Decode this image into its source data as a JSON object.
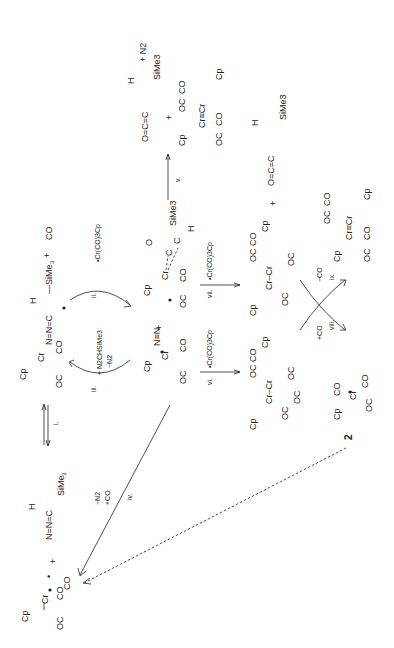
{
  "scheme": {
    "orientation": "rotated 90 degrees counterclockwise",
    "steps": {
      "i": "i.",
      "ii": "ii.",
      "iii": "iii.",
      "iv": "iv.",
      "v": "v.",
      "vi": "vi.",
      "vii": "vii.",
      "viii": "viii.",
      "ix": "ix."
    },
    "reagents": {
      "ii": "•Cr(CO)3Cp",
      "iii_top": "+ N2CHSiMe3",
      "iii_bottom": "−N2",
      "iv_top": "−N2",
      "iv_bottom": "+CO",
      "vi": "•Cr(CO)3Cp",
      "vii": "•Cr(CO)3Cp",
      "viii": "+CO",
      "ix": "−CO"
    },
    "species": {
      "start_radical": "•Cr(CO)3Cp",
      "diazo": "N2CHSiMe3 (N=N=C(H)SiMe3)",
      "diazo_adduct": "Cp(CO)2Cr–N=N=C•(H)SiMe3 + CO",
      "dinitrogen_complex": "•Cr(CO)2(N≡N)Cp",
      "ketene_complex": "•Cr(CO)2Cp(η2-O=C=C(H)SiMe3)",
      "ketene_product": "O=C=C(H)SiMe3",
      "n2": "N2",
      "triple_bond_dimer": "Cp(CO)2Cr≡Cr(CO)2Cp",
      "dimer_vi": "[CpCr(CO)3]2",
      "dimer_vii": "[CpCr(CO)3]2",
      "compound_label": "2"
    }
  }
}
